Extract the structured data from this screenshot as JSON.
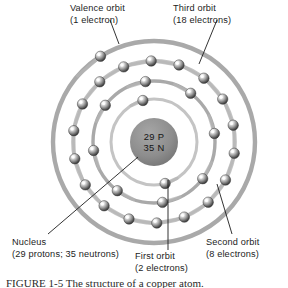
{
  "figure": {
    "kind": "bohr-atom-diagram",
    "element": "copper",
    "caption": "FIGURE 1-5   The structure of a copper atom.",
    "caption_visible_fragment": "FIGURE 1-5   The structure of a copper atom."
  },
  "nucleus": {
    "line1": "29 P",
    "line2": "35 N",
    "protons": 29,
    "neutrons": 35,
    "fill_color": "#8d8d8d",
    "center": {
      "x": 154,
      "y": 142
    },
    "radius": 24
  },
  "labels": {
    "valence": {
      "line1": "Valence orbit",
      "line2": "(1 electron)"
    },
    "third": {
      "line1": "Third orbit",
      "line2": "(18 electrons)"
    },
    "nucleus": {
      "line1": "Nucleus",
      "line2": "(29 protons; 35 neutrons)"
    },
    "first": {
      "line1": "First orbit",
      "line2": "(2 electrons)"
    },
    "second": {
      "line1": "Second orbit",
      "line2": "(8 electrons)"
    }
  },
  "colors": {
    "orbit_ring": "#a9a9a9",
    "orbit_ring_light": "#c4c4c4",
    "nucleus": "#8d8d8d",
    "electron_dark": "#4a4a4a",
    "electron_light": "#f2f2f2",
    "leader_line": "#1c1c1c",
    "text": "#1c1c1c",
    "background": "#ffffff"
  },
  "chart_data": {
    "type": "scatter",
    "xlabel": "",
    "ylabel": "",
    "center": {
      "x": 154,
      "y": 142
    },
    "shells": [
      {
        "name": "First orbit",
        "index": 1,
        "electron_count": 2,
        "radius": 43,
        "ring_width": 3.0,
        "start_angle_deg": 255
      },
      {
        "name": "Second orbit",
        "index": 2,
        "electron_count": 8,
        "radius": 61,
        "ring_width": 3.4,
        "start_angle_deg": 262
      },
      {
        "name": "Third orbit",
        "index": 3,
        "electron_count": 18,
        "radius": 81,
        "ring_width": 3.8,
        "start_angle_deg": 268
      },
      {
        "name": "Valence orbit",
        "index": 4,
        "electron_count": 1,
        "radius": 101,
        "ring_width": 4.4,
        "start_angle_deg": 238
      }
    ],
    "electron_radius": 5.2,
    "total_electrons": 29
  },
  "leaders": [
    {
      "name": "valence-leader",
      "x1": 110,
      "y1": 20,
      "x2": 119,
      "y2": 44
    },
    {
      "name": "third-leader",
      "x1": 217,
      "y1": 20,
      "x2": 199,
      "y2": 64
    },
    {
      "name": "nucleus-leader",
      "x1": 48,
      "y1": 234,
      "x2": 138,
      "y2": 157
    },
    {
      "name": "first-leader",
      "x1": 168,
      "y1": 250,
      "x2": 168,
      "y2": 180
    },
    {
      "name": "second-leader",
      "x1": 232,
      "y1": 234,
      "x2": 217,
      "y2": 184
    }
  ]
}
